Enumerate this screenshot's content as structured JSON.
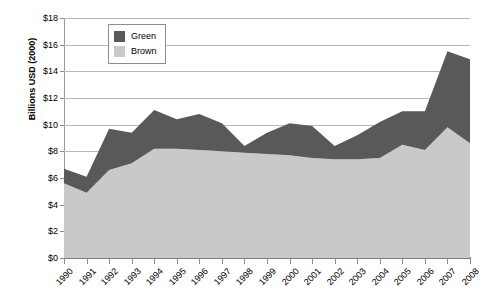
{
  "chart_data": {
    "type": "area",
    "stacked": true,
    "title": "",
    "xlabel": "",
    "ylabel": "Billions USD (2000)",
    "ylim": [
      0,
      18
    ],
    "ytick_values": [
      0,
      2,
      4,
      6,
      8,
      10,
      12,
      14,
      16,
      18
    ],
    "ytick_labels": [
      "$0",
      "$2",
      "$4",
      "$6",
      "$8",
      "$10",
      "$12",
      "$14",
      "$16",
      "$18"
    ],
    "grid": true,
    "legend_position": "top-left-inside",
    "categories": [
      "1990",
      "1991",
      "1992",
      "1993",
      "1994",
      "1995",
      "1996",
      "1997",
      "1998",
      "1999",
      "2000",
      "2001",
      "2002",
      "2003",
      "2004",
      "2005",
      "2006",
      "2007",
      "2008"
    ],
    "series": [
      {
        "name": "Brown",
        "color": "#c9c9c9",
        "values": [
          5.6,
          4.9,
          6.6,
          7.1,
          8.2,
          8.2,
          8.1,
          8.0,
          7.9,
          7.8,
          7.7,
          7.5,
          7.4,
          7.4,
          7.5,
          8.5,
          8.1,
          9.8,
          8.6
        ]
      },
      {
        "name": "Green",
        "color": "#59595a",
        "values": [
          1.1,
          1.2,
          3.1,
          2.3,
          2.9,
          2.2,
          2.7,
          2.1,
          0.5,
          1.6,
          2.4,
          2.4,
          1.0,
          1.8,
          2.7,
          2.5,
          2.9,
          5.7,
          6.3
        ]
      }
    ],
    "totals": [
      6.7,
      6.1,
      9.7,
      9.4,
      11.1,
      10.4,
      10.8,
      10.1,
      8.4,
      9.4,
      10.1,
      9.9,
      8.4,
      9.2,
      10.2,
      11.0,
      11.0,
      15.5,
      14.9
    ]
  },
  "legend": {
    "items": [
      {
        "label": "Green",
        "color": "#59595a"
      },
      {
        "label": "Brown",
        "color": "#c9c9c9"
      }
    ]
  }
}
